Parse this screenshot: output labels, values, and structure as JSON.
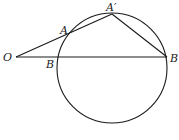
{
  "diagram": {
    "type": "geometry",
    "circle": {
      "cx": 112,
      "cy": 68,
      "r": 55
    },
    "points": {
      "O": {
        "label": "O",
        "x": 16,
        "y": 57
      },
      "A": {
        "label": "A",
        "x": 71,
        "y": 33
      },
      "A_prime": {
        "label": "A′",
        "x": 112,
        "y": 14
      },
      "B_near": {
        "label": "B",
        "x": 57,
        "y": 57
      },
      "B_far": {
        "label": "B",
        "x": 167,
        "y": 57
      }
    },
    "segments": [
      [
        "O",
        "A_prime"
      ],
      [
        "O",
        "B_far"
      ],
      [
        "A_prime",
        "B_far"
      ]
    ]
  }
}
